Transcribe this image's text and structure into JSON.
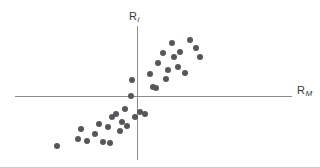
{
  "figure": {
    "name": "characteristic-line-scatter",
    "background_color": "#ffffff",
    "axis_color": "#8d8d8d",
    "point_color": "#555759",
    "rule_color": "#c9c9c9"
  },
  "axes": {
    "y": {
      "label_base": "R",
      "label_sub": "i",
      "label_full": "Ri",
      "line": {
        "x": 137,
        "y_top": 26,
        "y_bottom": 160
      }
    },
    "x": {
      "label_base": "R",
      "label_sub": "M",
      "label_full": "RM",
      "line": {
        "y": 96,
        "x_left": 15,
        "x_right": 292
      }
    }
  },
  "chart_data": {
    "type": "scatter",
    "title": "",
    "xlabel": "RM",
    "ylabel": "Ri",
    "grid": false,
    "legend": null,
    "origin_px": {
      "x": 137,
      "y": 96
    },
    "xlim": [
      -10,
      10
    ],
    "ylim": [
      -10,
      10
    ],
    "px_per_unit": {
      "x": 13.5,
      "y": 9.0
    },
    "series": [
      {
        "name": "security-returns",
        "marker": "circle",
        "color": "#555759",
        "n_points": 35,
        "points_px": [
          [
            57,
            146
          ],
          [
            78,
            139
          ],
          [
            81,
            129
          ],
          [
            87,
            141
          ],
          [
            95,
            134
          ],
          [
            99,
            124
          ],
          [
            103,
            142
          ],
          [
            108,
            127
          ],
          [
            110,
            143
          ],
          [
            112,
            117
          ],
          [
            116,
            114
          ],
          [
            120,
            131
          ],
          [
            122,
            122
          ],
          [
            125,
            109
          ],
          [
            127,
            126
          ],
          [
            131,
            96
          ],
          [
            132,
            80
          ],
          [
            135,
            117
          ],
          [
            140,
            112
          ],
          [
            145,
            114
          ],
          [
            150,
            74
          ],
          [
            153,
            87
          ],
          [
            156,
            88
          ],
          [
            158,
            63
          ],
          [
            163,
            53
          ],
          [
            166,
            79
          ],
          [
            168,
            70
          ],
          [
            172,
            43
          ],
          [
            174,
            57
          ],
          [
            178,
            67
          ],
          [
            180,
            52
          ],
          [
            185,
            73
          ],
          [
            190,
            40
          ],
          [
            196,
            48
          ],
          [
            200,
            57
          ]
        ],
        "points_data": [
          [
            -5.9,
            -5.6
          ],
          [
            -4.4,
            -4.8
          ],
          [
            -4.1,
            -3.7
          ],
          [
            -3.7,
            -5.0
          ],
          [
            -3.1,
            -4.2
          ],
          [
            -2.8,
            -3.1
          ],
          [
            -2.5,
            -5.1
          ],
          [
            -2.1,
            -3.4
          ],
          [
            -2.0,
            -5.2
          ],
          [
            -1.9,
            -2.3
          ],
          [
            -1.6,
            -2.0
          ],
          [
            -1.3,
            -3.9
          ],
          [
            -1.1,
            -2.9
          ],
          [
            -0.9,
            -1.4
          ],
          [
            -0.7,
            -3.3
          ],
          [
            -0.4,
            0.0
          ],
          [
            -0.4,
            1.8
          ],
          [
            -0.1,
            -2.3
          ],
          [
            0.2,
            -1.8
          ],
          [
            0.6,
            -2.0
          ],
          [
            1.0,
            2.4
          ],
          [
            1.2,
            1.0
          ],
          [
            1.4,
            0.9
          ],
          [
            1.6,
            3.7
          ],
          [
            1.9,
            4.8
          ],
          [
            2.1,
            1.9
          ],
          [
            2.3,
            2.9
          ],
          [
            2.6,
            5.9
          ],
          [
            2.7,
            4.3
          ],
          [
            3.0,
            3.2
          ],
          [
            3.2,
            4.9
          ],
          [
            3.6,
            2.6
          ],
          [
            3.9,
            6.2
          ],
          [
            4.4,
            5.3
          ],
          [
            4.7,
            4.3
          ]
        ]
      }
    ]
  }
}
